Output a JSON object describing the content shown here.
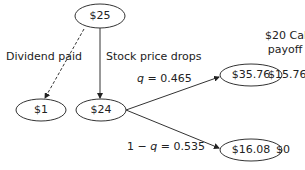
{
  "nodes": {
    "root": {
      "value": "$25"
    },
    "dividend": {
      "value": "$1"
    },
    "after_drop": {
      "value": "$24"
    },
    "up": {
      "value": "$35.76"
    },
    "down": {
      "value": "$16.08"
    }
  },
  "edges": {
    "dividend_label": "Dividend paid",
    "drop_label": "Stock price drops",
    "up_prob": {
      "var": "q",
      "eq": " = 0.465"
    },
    "down_prob": {
      "prefix": "1 − ",
      "var": "q",
      "eq": " = 0.535"
    }
  },
  "payoff": {
    "header_line1": "$20 Call",
    "header_line2": "payoff",
    "up_value": "$15.76",
    "down_value": "$0"
  }
}
